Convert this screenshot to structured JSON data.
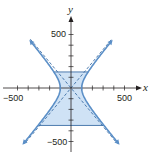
{
  "chart_data": {
    "type": "line",
    "title": "",
    "xlabel": "x",
    "ylabel": "y",
    "xlim": [
      -560,
      620
    ],
    "ylim": [
      -560,
      720
    ],
    "grid": false,
    "tick_step": 100,
    "x_tick_labels": [
      {
        "value": -500,
        "label": "−500"
      },
      {
        "value": 500,
        "label": "500"
      }
    ],
    "y_tick_labels": [
      {
        "value": 500,
        "label": "500"
      },
      {
        "value": -500,
        "label": "−500"
      }
    ],
    "hyperbola": {
      "equation": "x^2/100^2 - y^2/120^2 = 1",
      "a": 100,
      "b": 120,
      "y_range": [
        -520,
        440
      ],
      "color": "#5b8fc7"
    },
    "asymptotes": {
      "equations": [
        "y = 1.2x",
        "y = -1.2x"
      ],
      "style": "dashed",
      "color": "#3d6ea5"
    },
    "shaded_region": {
      "description": "region between branches from y = -350 to y = 150",
      "y_bottom": -350,
      "y_top": 150,
      "fill": "#cfe2f5",
      "edge": "#3d6ea5"
    }
  },
  "labels": {
    "x_axis": "x",
    "y_axis": "y",
    "x_neg": "−500",
    "x_pos": "500",
    "y_pos": "500",
    "y_neg": "−500"
  }
}
